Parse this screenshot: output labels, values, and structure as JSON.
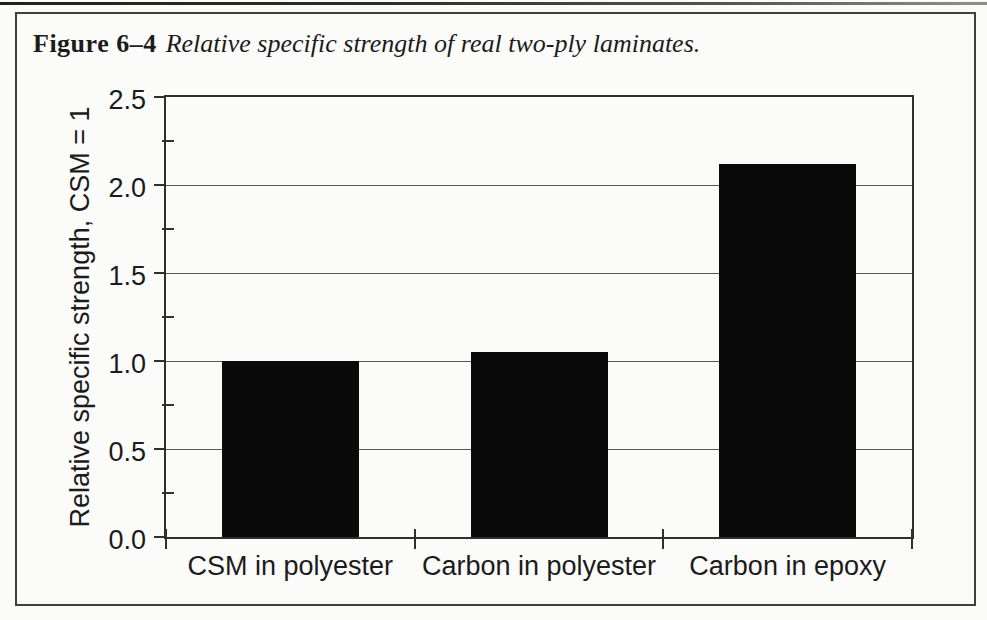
{
  "figure": {
    "caption_label": "Figure 6–4",
    "caption_text": "Relative specific strength of real two-ply laminates."
  },
  "chart_data": {
    "type": "bar",
    "categories": [
      "CSM in polyester",
      "Carbon in polyester",
      "Carbon in epoxy"
    ],
    "values": [
      1.0,
      1.05,
      2.12
    ],
    "title": "",
    "xlabel": "",
    "ylabel": "Relative specific strength, CSM = 1",
    "ylim": [
      0.0,
      2.5
    ],
    "ytick_labels": [
      "0.0",
      "0.5",
      "1.0",
      "1.5",
      "2.0",
      "2.5"
    ],
    "ytick_major_step": 0.5,
    "ytick_minor_step": 0.25,
    "grid": "horizontal-at-major-ticks",
    "legend": "none",
    "bar_color": "#0a0a0a",
    "axis_color": "#2f2f2f",
    "grid_color": "#575757",
    "text_color": "#1b1b1b"
  }
}
